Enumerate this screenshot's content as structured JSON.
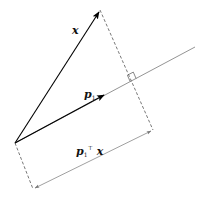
{
  "diagram": {
    "type": "vector-projection",
    "labels": {
      "x_vector": "x",
      "p1_vector": "p",
      "p1_sub": "1",
      "projection_p": "p",
      "projection_sub": "1",
      "projection_sup": "⊤",
      "projection_x": "x"
    },
    "colors": {
      "vector": "#000000",
      "line": "#888888",
      "dashed": "#666666",
      "dimension": "#888888"
    },
    "points": {
      "origin": [
        15,
        143
      ],
      "x_tip": [
        100,
        10
      ],
      "p1_tip": [
        105,
        94
      ],
      "foot": [
        137,
        78
      ],
      "line_end": [
        195,
        47
      ],
      "dim_start": [
        33,
        189
      ],
      "dim_end": [
        153,
        130
      ]
    }
  }
}
